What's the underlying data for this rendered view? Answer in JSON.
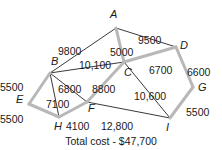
{
  "diagram": {
    "total_cost_label": "Total cost - $47,700",
    "colors": {
      "selected_edge": "#b8b8b8",
      "unselected_edge": "#3a3a3a",
      "text": "#1a1a1a"
    },
    "nodes": [
      {
        "id": "A",
        "x": 116,
        "y": 28,
        "lx": 110,
        "ly": 18
      },
      {
        "id": "B",
        "x": 50,
        "y": 73,
        "lx": 51,
        "ly": 65
      },
      {
        "id": "C",
        "x": 124,
        "y": 62,
        "lx": 124,
        "ly": 76
      },
      {
        "id": "D",
        "x": 176,
        "y": 47,
        "lx": 180,
        "ly": 49
      },
      {
        "id": "E",
        "x": 29,
        "y": 104,
        "lx": 16,
        "ly": 103
      },
      {
        "id": "F",
        "x": 87,
        "y": 102,
        "lx": 88,
        "ly": 112
      },
      {
        "id": "G",
        "x": 193,
        "y": 87,
        "lx": 198,
        "ly": 91
      },
      {
        "id": "H",
        "x": 59,
        "y": 117,
        "lx": 54,
        "ly": 130
      },
      {
        "id": "I",
        "x": 170,
        "y": 118,
        "lx": 166,
        "ly": 131
      }
    ],
    "edges": [
      {
        "from": "A",
        "to": "B",
        "weight": "9800",
        "selected": false,
        "wx": 58,
        "wy": 46
      },
      {
        "from": "A",
        "to": "D",
        "weight": "9500",
        "selected": false,
        "wx": 138,
        "wy": 35
      },
      {
        "from": "A",
        "to": "C",
        "weight": "5000",
        "selected": true,
        "wx": 110,
        "wy": 47
      },
      {
        "from": "B",
        "to": "C",
        "weight": "10,100",
        "selected": false,
        "wx": 79,
        "wy": 60
      },
      {
        "from": "C",
        "to": "D",
        "weight": "6700",
        "selected": true,
        "wx": 149,
        "wy": 65
      },
      {
        "from": "D",
        "to": "G",
        "weight": "6600",
        "selected": true,
        "wx": 187,
        "wy": 67
      },
      {
        "from": "B",
        "to": "E",
        "weight": "5500",
        "selected": true,
        "wx": 0,
        "wy": 82
      },
      {
        "from": "B",
        "to": "F",
        "weight": "6800",
        "selected": false,
        "wx": 58,
        "wy": 84
      },
      {
        "from": "B",
        "to": "H",
        "weight": "7100",
        "selected": false,
        "wx": 46,
        "wy": 99
      },
      {
        "from": "C",
        "to": "F",
        "weight": "8800",
        "selected": true,
        "wx": 92,
        "wy": 84
      },
      {
        "from": "C",
        "to": "I",
        "weight": "10,600",
        "selected": false,
        "wx": 134,
        "wy": 91
      },
      {
        "from": "E",
        "to": "H",
        "weight": "5500",
        "selected": true,
        "wx": 0,
        "wy": 114
      },
      {
        "from": "H",
        "to": "F",
        "weight": "4100",
        "selected": true,
        "wx": 66,
        "wy": 121
      },
      {
        "from": "F",
        "to": "I",
        "weight": "12,800",
        "selected": false,
        "wx": 101,
        "wy": 121
      },
      {
        "from": "G",
        "to": "I",
        "weight": "5500",
        "selected": true,
        "wx": 186,
        "wy": 107
      }
    ]
  }
}
